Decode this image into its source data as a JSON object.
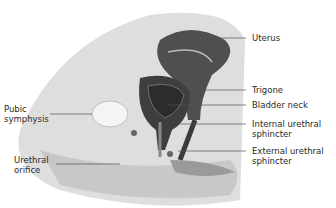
{
  "diagram": {
    "labels": {
      "uterus": "Uterus",
      "trigone": "Trigone",
      "bladder_neck": "Bladder neck",
      "internal_sphincter": "Internal urethral\nsphincter",
      "external_sphincter": "External urethral\nsphincter",
      "pubic_symphysis": "Pubic\nsymphysis",
      "urethral_orifice": "Urethral\norifice"
    },
    "colors": {
      "organ_dark": "#4a4a4a",
      "organ_darker": "#2e2e2e",
      "tissue_light": "#d9d9d9",
      "tissue_mid": "#bdbdbd",
      "bone": "#f2f2f2",
      "leader_line": "#555555"
    }
  }
}
